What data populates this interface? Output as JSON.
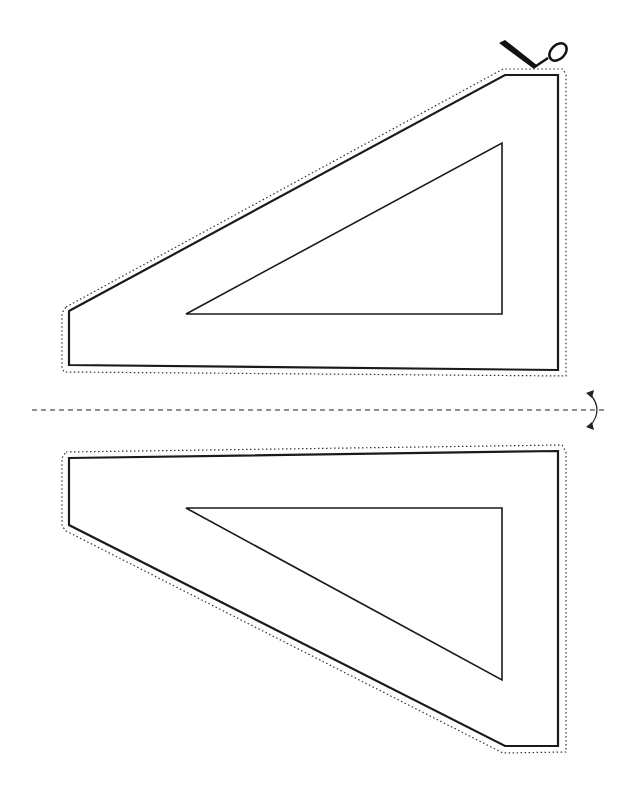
{
  "diagram": {
    "type": "cut-out template",
    "colors": {
      "line": "#1a1a1a",
      "background": "#ffffff",
      "dotted": "#333333"
    },
    "upper_piece": {
      "outer": "69,311 505,75 558,75 558,370 69,365",
      "inner": "186,314 502,143 502,314",
      "cut_line": "66,307 503,69 563,69 566,75 566,376 64,372 62,367 62,313"
    },
    "lower_piece": {
      "outer": "69,458 558,451 558,746 505,746 69,525",
      "inner": "186,508 502,508 502,680",
      "cut_line": "66,452 562,445 566,452 566,752 503,753 66,531 62,526 62,458"
    },
    "fold_line": {
      "x1": 32,
      "y1": 410,
      "x2": 608,
      "y2": 410
    },
    "icons": {
      "scissors": "scissors-icon",
      "fold": "fold-arrow-icon"
    }
  }
}
